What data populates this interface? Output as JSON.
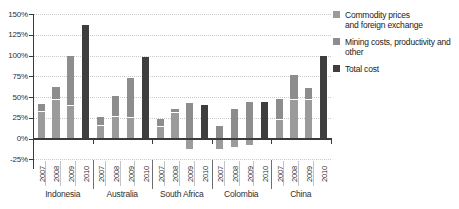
{
  "chart_data": {
    "type": "bar",
    "stacked": true,
    "unit": "%",
    "title": "",
    "xlabel": "",
    "ylabel": "",
    "ylim": [
      -25,
      150
    ],
    "grid": "dotted-horizontal",
    "legend_position": "right",
    "y_ticks": [
      {
        "value": 150,
        "label": "150%"
      },
      {
        "value": 125,
        "label": "125%"
      },
      {
        "value": 100,
        "label": "100%"
      },
      {
        "value": 75,
        "label": "75%"
      },
      {
        "value": 50,
        "label": "50%"
      },
      {
        "value": 25,
        "label": "25%"
      },
      {
        "value": 0,
        "label": "0%"
      },
      {
        "value": -25,
        "label": "-25%"
      }
    ],
    "years": [
      "2007",
      "2008",
      "2009",
      "2010"
    ],
    "series_info": [
      {
        "key": "commodity",
        "label": "Commodity prices and foreign exchange",
        "label_lines": [
          "Commodity prices",
          "and foreign exchange"
        ],
        "color": "#9b9b9b"
      },
      {
        "key": "mining",
        "label": "Mining costs, productivity and other",
        "label_lines": [
          "Mining costs, productivity and",
          "other"
        ],
        "color": "#8d8d8d"
      },
      {
        "key": "total",
        "label": "Total cost",
        "label_lines": [
          "Total cost"
        ],
        "color": "#3e3e3e"
      }
    ],
    "countries": [
      {
        "name": "Indonesia",
        "years": [
          {
            "year": "2007",
            "commodity": 33,
            "mining": 8,
            "total": null
          },
          {
            "year": "2008",
            "commodity": 48,
            "mining": 14,
            "total": null
          },
          {
            "year": "2009",
            "commodity": 40,
            "mining": 60,
            "total": null
          },
          {
            "year": "2010",
            "commodity": null,
            "mining": null,
            "total": 137
          }
        ]
      },
      {
        "name": "Australia",
        "years": [
          {
            "year": "2007",
            "commodity": 16,
            "mining": 10,
            "total": null
          },
          {
            "year": "2008",
            "commodity": 27,
            "mining": 24,
            "total": null
          },
          {
            "year": "2009",
            "commodity": 26,
            "mining": 47,
            "total": null
          },
          {
            "year": "2010",
            "commodity": null,
            "mining": null,
            "total": 98
          }
        ]
      },
      {
        "name": "South Africa",
        "years": [
          {
            "year": "2007",
            "commodity": 15,
            "mining": 9,
            "total": null
          },
          {
            "year": "2008",
            "commodity": 32,
            "mining": 3,
            "total": null
          },
          {
            "year": "2009",
            "commodity": -13,
            "mining": 43,
            "total": null
          },
          {
            "year": "2010",
            "commodity": null,
            "mining": null,
            "total": 40
          }
        ]
      },
      {
        "name": "Colombia",
        "years": [
          {
            "year": "2007",
            "commodity": -13,
            "mining": 15,
            "total": null
          },
          {
            "year": "2008",
            "commodity": -10,
            "mining": 35,
            "total": null
          },
          {
            "year": "2009",
            "commodity": -8,
            "mining": 44,
            "total": null
          },
          {
            "year": "2010",
            "commodity": null,
            "mining": null,
            "total": 44
          }
        ]
      },
      {
        "name": "China",
        "years": [
          {
            "year": "2007",
            "commodity": 23,
            "mining": 24,
            "total": null
          },
          {
            "year": "2008",
            "commodity": 47,
            "mining": 30,
            "total": null
          },
          {
            "year": "2009",
            "commodity": 48,
            "mining": 13,
            "total": null
          },
          {
            "year": "2010",
            "commodity": null,
            "mining": null,
            "total": 100
          }
        ]
      }
    ]
  }
}
